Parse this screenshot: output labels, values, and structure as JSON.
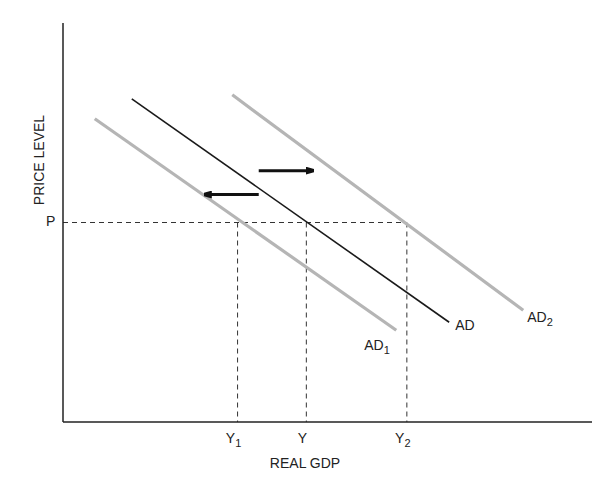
{
  "chart_data": {
    "type": "line",
    "title": "",
    "xlabel": "REAL GDP",
    "ylabel": "PRICE LEVEL",
    "xlim": [
      0,
      100
    ],
    "ylim": [
      0,
      100
    ],
    "price_level": {
      "label": "P",
      "value": 50
    },
    "series": [
      {
        "name": "AD",
        "label": "AD",
        "sub": "",
        "color": "#1a1a1a",
        "points": [
          [
            13,
            81
          ],
          [
            73,
            25
          ]
        ]
      },
      {
        "name": "AD1",
        "label": "AD",
        "sub": "1",
        "color": "#b5b5b5",
        "points": [
          [
            6,
            76
          ],
          [
            63,
            23
          ]
        ]
      },
      {
        "name": "AD2",
        "label": "AD",
        "sub": "2",
        "color": "#b5b5b5",
        "points": [
          [
            32,
            82
          ],
          [
            87,
            28
          ]
        ]
      }
    ],
    "x_markers": [
      {
        "name": "Y1",
        "label": "Y",
        "sub": "1",
        "value": 33
      },
      {
        "name": "Y",
        "label": "Y",
        "sub": "",
        "value": 46
      },
      {
        "name": "Y2",
        "label": "Y",
        "sub": "2",
        "value": 65
      }
    ],
    "arrows": [
      {
        "name": "shift-right-arrow",
        "from": [
          37,
          63
        ],
        "to": [
          47,
          63
        ]
      },
      {
        "name": "shift-left-arrow",
        "from": [
          37,
          57
        ],
        "to": [
          27,
          57
        ]
      }
    ]
  }
}
